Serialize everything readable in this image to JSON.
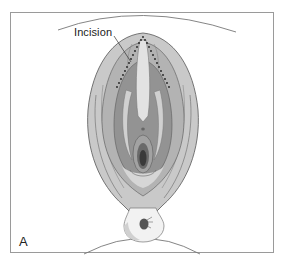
{
  "figure": {
    "panel_letter": "A",
    "callouts": [
      {
        "label": "Incision"
      }
    ],
    "colors": {
      "frame": "#9a9a9a",
      "outer_fill": "#c8c8c8",
      "mid_fill": "#b0b0b0",
      "inner_fill": "#8e8e8e",
      "light_fill": "#dcdcdc",
      "dark_center": "#3a3a3a",
      "line": "#555555",
      "incision_dots": "#222222"
    }
  }
}
